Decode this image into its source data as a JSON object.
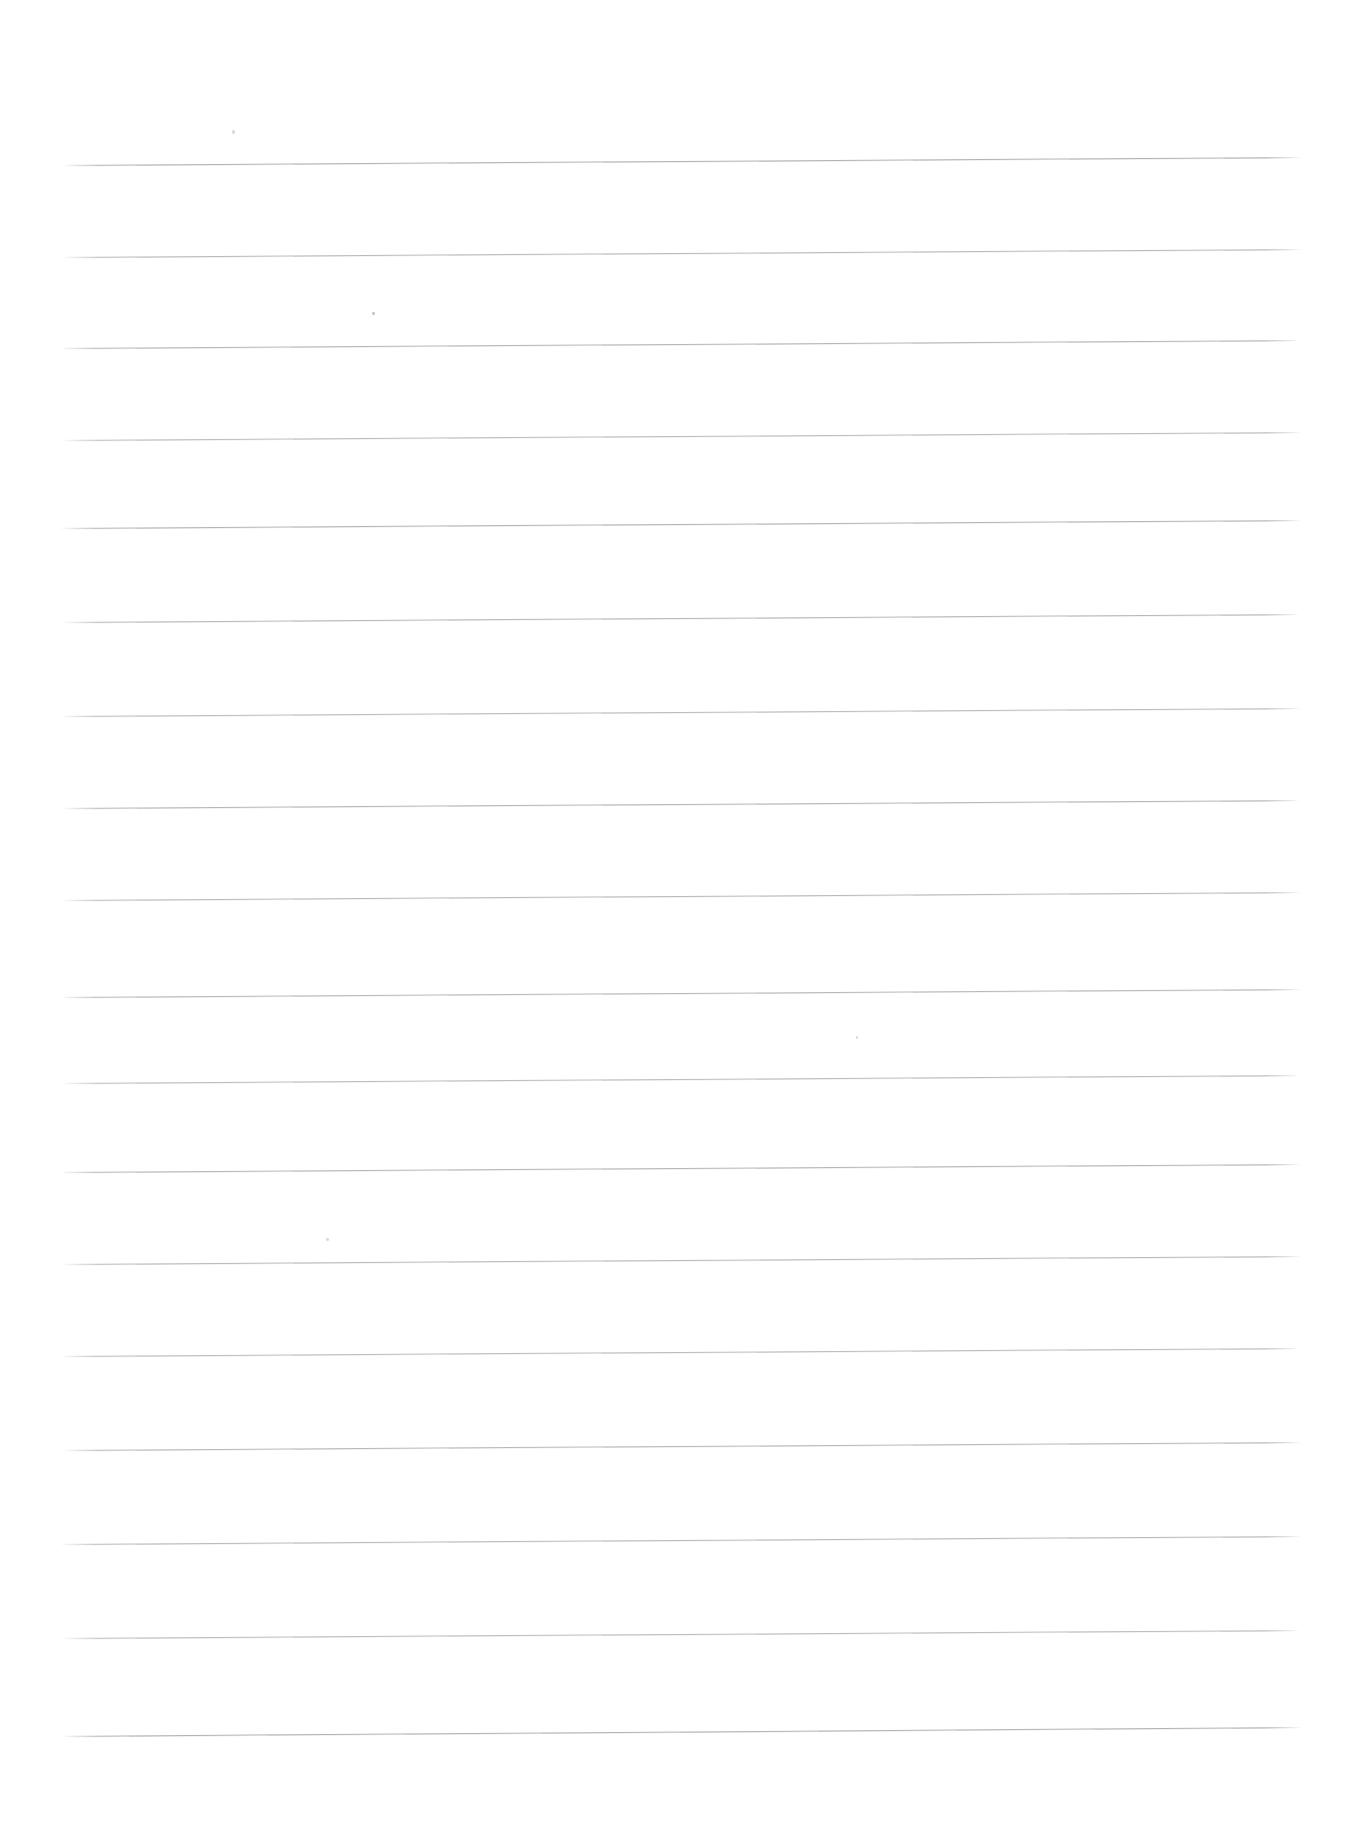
{
  "document": {
    "kind": "scanned-lined-paper",
    "title": "Blank Ruled Notebook Page",
    "description": "Scanned blank sheet of wide-ruled writing paper with no handwriting or printed text.",
    "page_width": 1364,
    "page_height": 1841,
    "background_color": "#ffffff",
    "rule_color": "#787c82",
    "content_text": "",
    "margin_line_present": false,
    "header_text": "",
    "footer_text": ""
  },
  "ruling": {
    "line_count": 18,
    "first_line_y": 165,
    "line_spacing": 92,
    "left_x": 62,
    "right_x": 1302,
    "tilt_px": -8,
    "lines": [
      {
        "index": 1,
        "y_left": 165,
        "y_right": 157,
        "x_start": 62,
        "x_end": 1302,
        "opacity": 0.8
      },
      {
        "index": 2,
        "y_left": 257,
        "y_right": 249,
        "x_start": 62,
        "x_end": 1302,
        "opacity": 0.72
      },
      {
        "index": 3,
        "y_left": 348,
        "y_right": 340,
        "x_start": 60,
        "x_end": 1300,
        "opacity": 0.76
      },
      {
        "index": 4,
        "y_left": 440,
        "y_right": 432,
        "x_start": 62,
        "x_end": 1302,
        "opacity": 0.7
      },
      {
        "index": 5,
        "y_left": 528,
        "y_right": 520,
        "x_start": 60,
        "x_end": 1302,
        "opacity": 0.78
      },
      {
        "index": 6,
        "y_left": 622,
        "y_right": 614,
        "x_start": 62,
        "x_end": 1300,
        "opacity": 0.74
      },
      {
        "index": 7,
        "y_left": 716,
        "y_right": 708,
        "x_start": 60,
        "x_end": 1302,
        "opacity": 0.7
      },
      {
        "index": 8,
        "y_left": 808,
        "y_right": 800,
        "x_start": 62,
        "x_end": 1300,
        "opacity": 0.76
      },
      {
        "index": 9,
        "y_left": 900,
        "y_right": 892,
        "x_start": 62,
        "x_end": 1302,
        "opacity": 0.72
      },
      {
        "index": 10,
        "y_left": 997,
        "y_right": 989,
        "x_start": 60,
        "x_end": 1302,
        "opacity": 0.74
      },
      {
        "index": 11,
        "y_left": 1083,
        "y_right": 1075,
        "x_start": 62,
        "x_end": 1300,
        "opacity": 0.7
      },
      {
        "index": 12,
        "y_left": 1172,
        "y_right": 1164,
        "x_start": 60,
        "x_end": 1302,
        "opacity": 0.76
      },
      {
        "index": 13,
        "y_left": 1264,
        "y_right": 1256,
        "x_start": 62,
        "x_end": 1302,
        "opacity": 0.72
      },
      {
        "index": 14,
        "y_left": 1356,
        "y_right": 1348,
        "x_start": 60,
        "x_end": 1300,
        "opacity": 0.7
      },
      {
        "index": 15,
        "y_left": 1450,
        "y_right": 1442,
        "x_start": 62,
        "x_end": 1302,
        "opacity": 0.74
      },
      {
        "index": 16,
        "y_left": 1544,
        "y_right": 1536,
        "x_start": 60,
        "x_end": 1302,
        "opacity": 0.72
      },
      {
        "index": 17,
        "y_left": 1638,
        "y_right": 1630,
        "x_start": 62,
        "x_end": 1300,
        "opacity": 0.7
      },
      {
        "index": 18,
        "y_left": 1736,
        "y_right": 1727,
        "x_start": 62,
        "x_end": 1302,
        "opacity": 0.8
      }
    ]
  },
  "artifacts": {
    "specks": [
      {
        "x": 232,
        "y": 130,
        "w": 3,
        "h": 4,
        "faint": true
      },
      {
        "x": 372,
        "y": 312,
        "w": 3,
        "h": 3,
        "faint": false
      },
      {
        "x": 856,
        "y": 1036,
        "w": 2,
        "h": 3,
        "faint": true
      },
      {
        "x": 326,
        "y": 1238,
        "w": 3,
        "h": 3,
        "faint": true
      }
    ]
  }
}
